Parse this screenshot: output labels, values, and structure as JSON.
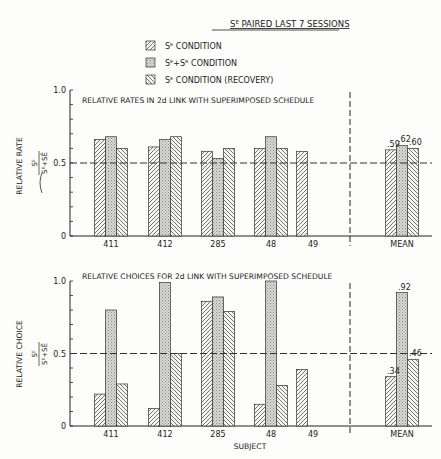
{
  "figure_title": "Sᴱ PAIRED LAST 7 SESSIONS",
  "legend": [
    {
      "key": "se",
      "label": "Sᴱ CONDITION",
      "pattern": "hatch-right"
    },
    {
      "key": "sesr",
      "label": "Sᴱ+Sᴿ CONDITION",
      "pattern": "stipple"
    },
    {
      "key": "rec",
      "label": "Sᴱ CONDITION (RECOVERY)",
      "pattern": "hatch-left"
    }
  ],
  "chart_data": [
    {
      "type": "bar",
      "title": "RELATIVE RATES IN 2d LINK WITH SUPERIMPOSED SCHEDULE",
      "ylabel": "RELATIVE RATE",
      "yformula_num": "Sᴱ",
      "yformula_den": "Sᴱ+SĒ",
      "xlabel": "",
      "ylim": [
        0,
        1.0
      ],
      "yticks": [
        "0",
        "0.5",
        "1.0"
      ],
      "reference_line": 0.5,
      "categories": [
        "411",
        "412",
        "285",
        "48",
        "49",
        "MEAN"
      ],
      "series": [
        {
          "name": "Sᴱ CONDITION",
          "values": [
            0.66,
            0.61,
            0.58,
            0.6,
            0.58,
            0.59
          ]
        },
        {
          "name": "Sᴱ+Sᴿ CONDITION",
          "values": [
            0.68,
            0.66,
            0.53,
            0.68,
            null,
            0.62
          ]
        },
        {
          "name": "Sᴱ CONDITION (RECOVERY)",
          "values": [
            0.6,
            0.68,
            0.6,
            0.6,
            null,
            0.6
          ]
        }
      ],
      "mean_labels": [
        ".59",
        ".62",
        ".60"
      ]
    },
    {
      "type": "bar",
      "title": "RELATIVE CHOICES FOR 2d LINK WITH SUPERIMPOSED SCHEDULE",
      "ylabel": "RELATIVE CHOICE",
      "yformula_num": "Sᴱ",
      "yformula_den": "Sᴱ+SĒ",
      "xlabel": "SUBJECT",
      "ylim": [
        0,
        1.0
      ],
      "yticks": [
        "0",
        "0.5",
        "1.0"
      ],
      "reference_line": 0.5,
      "categories": [
        "411",
        "412",
        "285",
        "48",
        "49",
        "MEAN"
      ],
      "series": [
        {
          "name": "Sᴱ CONDITION",
          "values": [
            0.22,
            0.12,
            0.86,
            0.15,
            0.39,
            0.34
          ]
        },
        {
          "name": "Sᴱ+Sᴿ CONDITION",
          "values": [
            0.8,
            0.99,
            0.89,
            1.0,
            null,
            0.92
          ]
        },
        {
          "name": "Sᴱ CONDITION (RECOVERY)",
          "values": [
            0.29,
            0.5,
            0.79,
            0.28,
            null,
            0.46
          ]
        }
      ],
      "mean_labels": [
        ".34",
        ".92",
        ".46"
      ]
    }
  ]
}
